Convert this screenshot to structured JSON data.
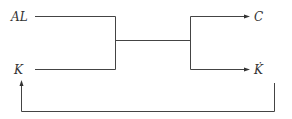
{
  "diagram": {
    "type": "block-flow",
    "nodes": {
      "input_top": "AL",
      "input_bottom": "K",
      "output_top": "C",
      "output_bottom": "K̇"
    },
    "edges": [
      {
        "from": "AL",
        "to": "junction",
        "label": ""
      },
      {
        "from": "K",
        "to": "junction",
        "label": ""
      },
      {
        "from": "junction",
        "to": "C",
        "label": ""
      },
      {
        "from": "junction",
        "to": "K̇",
        "label": ""
      },
      {
        "from": "K̇",
        "to": "K",
        "label": "",
        "kind": "feedback"
      }
    ],
    "colors": {
      "line": "#444444",
      "text": "#333333",
      "background": "#ffffff"
    }
  }
}
